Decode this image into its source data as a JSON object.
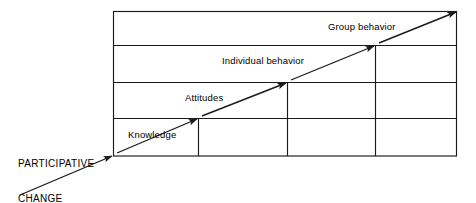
{
  "diagram": {
    "entry_label": {
      "line1": "PARTICIPATIVE",
      "line2": "CHANGE"
    },
    "steps": [
      {
        "id": "knowledge",
        "label": "Knowledge"
      },
      {
        "id": "attitudes",
        "label": "Attitudes"
      },
      {
        "id": "individual-behavior",
        "label": "Individual behavior"
      },
      {
        "id": "group-behavior",
        "label": "Group behavior"
      }
    ],
    "colors": {
      "stroke": "#1a1a1a",
      "background": "#ffffff",
      "text": "#000000"
    }
  }
}
